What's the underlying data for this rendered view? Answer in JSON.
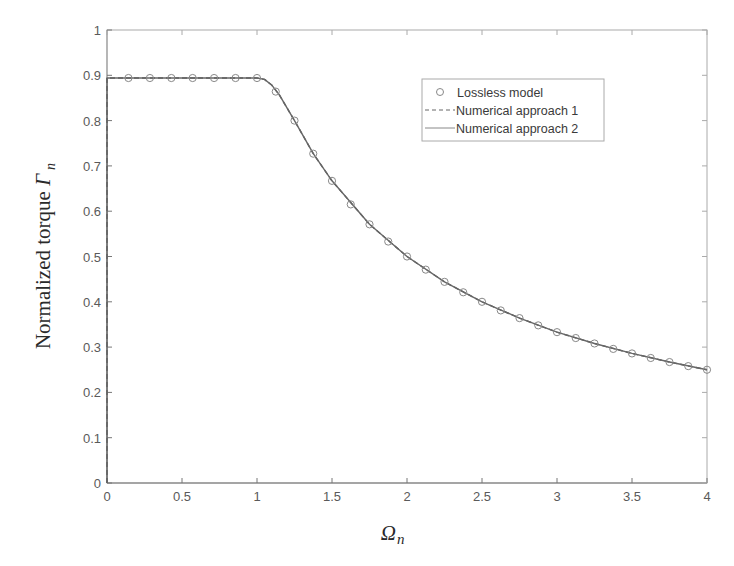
{
  "chart_data": {
    "type": "line",
    "title": "",
    "xlabel": "Ω_n",
    "ylabel": "Normalized torque Γ_n",
    "xlim": [
      0,
      4
    ],
    "ylim": [
      0,
      1
    ],
    "grid": false,
    "legend_position": "upper right (inside)",
    "x_ticks": [
      "0",
      "0.5",
      "1",
      "1.5",
      "2",
      "2.5",
      "3",
      "3.5",
      "4"
    ],
    "y_ticks": [
      "0",
      "0.1",
      "0.2",
      "0.3",
      "0.4",
      "0.5",
      "0.6",
      "0.7",
      "0.8",
      "0.9",
      "1"
    ],
    "legend": [
      "Lossless model",
      "Numerical approach 1",
      "Numerical approach 2"
    ],
    "series": [
      {
        "name": "Lossless model",
        "style": "circle markers",
        "x": [
          0.143,
          0.286,
          0.429,
          0.571,
          0.714,
          0.857,
          1.0,
          1.125,
          1.25,
          1.375,
          1.5,
          1.625,
          1.75,
          1.875,
          2.0,
          2.125,
          2.25,
          2.375,
          2.5,
          2.625,
          2.75,
          2.875,
          3.0,
          3.125,
          3.25,
          3.375,
          3.5,
          3.625,
          3.75,
          3.875,
          4.0
        ],
        "values": [
          0.894,
          0.894,
          0.894,
          0.894,
          0.894,
          0.894,
          0.894,
          0.864,
          0.8,
          0.727,
          0.667,
          0.615,
          0.571,
          0.533,
          0.5,
          0.471,
          0.444,
          0.421,
          0.4,
          0.381,
          0.364,
          0.348,
          0.333,
          0.32,
          0.308,
          0.296,
          0.286,
          0.276,
          0.267,
          0.258,
          0.25
        ]
      },
      {
        "name": "Numerical approach 1",
        "style": "dashed line",
        "x": [
          0,
          0,
          1.0,
          1.05,
          1.1,
          1.15,
          1.2,
          1.25,
          1.375,
          1.5,
          1.75,
          2.0,
          2.25,
          2.5,
          2.75,
          3.0,
          3.25,
          3.5,
          3.75,
          4.0
        ],
        "values": [
          0,
          0.894,
          0.894,
          0.891,
          0.878,
          0.856,
          0.828,
          0.8,
          0.727,
          0.667,
          0.571,
          0.5,
          0.444,
          0.4,
          0.364,
          0.333,
          0.308,
          0.286,
          0.267,
          0.25
        ]
      },
      {
        "name": "Numerical approach 2",
        "style": "solid line",
        "x": [
          0,
          0,
          1.0,
          1.05,
          1.1,
          1.15,
          1.2,
          1.25,
          1.375,
          1.5,
          1.75,
          2.0,
          2.25,
          2.5,
          2.75,
          3.0,
          3.25,
          3.5,
          3.75,
          4.0
        ],
        "values": [
          0,
          0.894,
          0.894,
          0.891,
          0.878,
          0.856,
          0.828,
          0.8,
          0.727,
          0.667,
          0.571,
          0.5,
          0.444,
          0.4,
          0.364,
          0.333,
          0.308,
          0.286,
          0.267,
          0.25
        ]
      }
    ]
  },
  "axes": {
    "xlabel_main": "Ω",
    "xlabel_sub": "n",
    "ylabel_main": "Normalized torque ",
    "ylabel_symbol": "Γ",
    "ylabel_sub": "n"
  },
  "legend": {
    "items": [
      {
        "label": "Lossless model"
      },
      {
        "label": "Numerical approach 1"
      },
      {
        "label": "Numerical approach 2"
      }
    ]
  },
  "colors": {
    "line": "#555555",
    "marker": "#888888",
    "axis": "#777777",
    "text": "#5a5a5a"
  }
}
